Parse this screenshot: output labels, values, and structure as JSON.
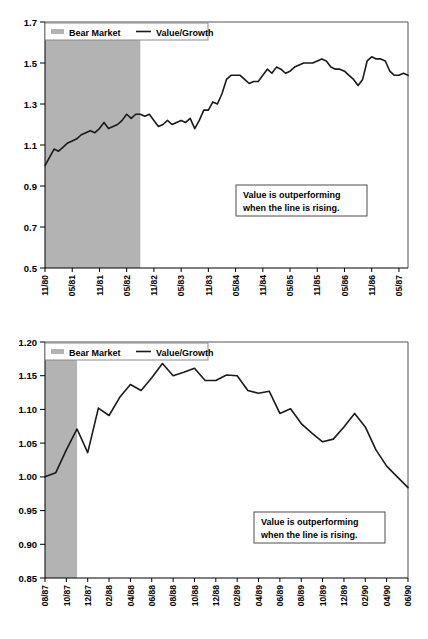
{
  "page": {
    "background": "#ffffff"
  },
  "colors": {
    "bear_band": "#b3b3b3",
    "series_line": "#1a1a1a",
    "axis": "#000000",
    "frame": "#555555",
    "annotation_border": "#4d4d4d"
  },
  "chart_data": [
    {
      "id": "chart-1",
      "type": "line",
      "title": "",
      "xlabel": "",
      "ylabel": "",
      "ylim": [
        0.5,
        1.7
      ],
      "yticks": [
        "0.5",
        "0.7",
        "0.9",
        "1.1",
        "1.3",
        "1.5",
        "1.7"
      ],
      "ytick_values": [
        0.5,
        0.7,
        0.9,
        1.1,
        1.3,
        1.5,
        1.7
      ],
      "grid": false,
      "legend_position": "top-left",
      "legend": [
        {
          "label": "Bear Market",
          "marker": "swatch",
          "color": "#b3b3b3"
        },
        {
          "label": "Value/Growth",
          "marker": "line",
          "color": "#1a1a1a"
        }
      ],
      "annotation": {
        "line1": "Value is outperforming",
        "line2": "when the line is rising."
      },
      "xticks": [
        "11/80",
        "05/81",
        "11/81",
        "05/82",
        "11/82",
        "05/83",
        "11/83",
        "05/84",
        "11/84",
        "05/85",
        "11/85",
        "05/86",
        "11/86",
        "05/87"
      ],
      "shaded_regions": [
        {
          "label": "Bear Market",
          "start": "11/80",
          "end": "08/82",
          "start_index": 0,
          "end_index": 21
        }
      ],
      "series": [
        {
          "name": "Value/Growth",
          "x": [
            "11/80",
            "12/80",
            "01/81",
            "02/81",
            "03/81",
            "04/81",
            "05/81",
            "06/81",
            "07/81",
            "08/81",
            "09/81",
            "10/81",
            "11/81",
            "12/81",
            "01/82",
            "02/82",
            "03/82",
            "04/82",
            "05/82",
            "06/82",
            "07/82",
            "08/82",
            "09/82",
            "10/82",
            "11/82",
            "12/82",
            "01/83",
            "02/83",
            "03/83",
            "04/83",
            "05/83",
            "06/83",
            "07/83",
            "08/83",
            "09/83",
            "10/83",
            "11/83",
            "12/83",
            "01/84",
            "02/84",
            "03/84",
            "04/84",
            "05/84",
            "06/84",
            "07/84",
            "08/84",
            "09/84",
            "10/84",
            "11/84",
            "12/84",
            "01/85",
            "02/85",
            "03/85",
            "04/85",
            "05/85",
            "06/85",
            "07/85",
            "08/85",
            "09/85",
            "10/85",
            "11/85",
            "12/85",
            "01/86",
            "02/86",
            "03/86",
            "04/86",
            "05/86",
            "06/86",
            "07/86",
            "08/86",
            "09/86",
            "10/86",
            "11/86",
            "12/86",
            "01/87",
            "02/87",
            "03/87",
            "04/87",
            "05/87",
            "06/87",
            "07/87"
          ],
          "values": [
            1.0,
            1.04,
            1.08,
            1.07,
            1.09,
            1.11,
            1.12,
            1.13,
            1.15,
            1.16,
            1.17,
            1.16,
            1.18,
            1.21,
            1.18,
            1.19,
            1.2,
            1.22,
            1.25,
            1.23,
            1.25,
            1.25,
            1.24,
            1.25,
            1.22,
            1.19,
            1.2,
            1.22,
            1.2,
            1.21,
            1.22,
            1.21,
            1.23,
            1.18,
            1.22,
            1.27,
            1.27,
            1.31,
            1.3,
            1.35,
            1.42,
            1.44,
            1.44,
            1.44,
            1.42,
            1.4,
            1.41,
            1.41,
            1.44,
            1.47,
            1.45,
            1.48,
            1.47,
            1.45,
            1.46,
            1.48,
            1.49,
            1.5,
            1.5,
            1.5,
            1.51,
            1.52,
            1.51,
            1.48,
            1.47,
            1.47,
            1.46,
            1.44,
            1.42,
            1.39,
            1.42,
            1.51,
            1.53,
            1.52,
            1.52,
            1.51,
            1.46,
            1.44,
            1.44,
            1.45,
            1.44
          ]
        }
      ]
    },
    {
      "id": "chart-2",
      "type": "line",
      "title": "",
      "xlabel": "",
      "ylabel": "",
      "ylim": [
        0.85,
        1.2
      ],
      "yticks": [
        "0.85",
        "0.90",
        "0.95",
        "1.00",
        "1.05",
        "1.10",
        "1.15",
        "1.20"
      ],
      "ytick_values": [
        0.85,
        0.9,
        0.95,
        1.0,
        1.05,
        1.1,
        1.15,
        1.2
      ],
      "grid": false,
      "legend_position": "top-left",
      "legend": [
        {
          "label": "Bear Market",
          "marker": "swatch",
          "color": "#b3b3b3"
        },
        {
          "label": "Value/Growth",
          "marker": "line",
          "color": "#1a1a1a"
        }
      ],
      "annotation": {
        "line1": "Value is outperforming",
        "line2": "when the line is rising."
      },
      "xticks": [
        "08/87",
        "10/87",
        "12/87",
        "02/88",
        "04/88",
        "06/88",
        "08/88",
        "10/88",
        "12/88",
        "02/89",
        "04/89",
        "06/89",
        "08/89",
        "10/89",
        "12/89",
        "02/90",
        "04/90",
        "06/90"
      ],
      "shaded_regions": [
        {
          "label": "Bear Market",
          "start": "08/87",
          "end": "11/87",
          "start_index": 0,
          "end_index": 3
        }
      ],
      "series": [
        {
          "name": "Value/Growth",
          "x": [
            "08/87",
            "09/87",
            "10/87",
            "11/87",
            "12/87",
            "01/88",
            "02/88",
            "03/88",
            "04/88",
            "05/88",
            "06/88",
            "07/88",
            "08/88",
            "09/88",
            "10/88",
            "11/88",
            "12/88",
            "01/89",
            "02/89",
            "03/89",
            "04/89",
            "05/89",
            "06/89",
            "07/89",
            "08/89",
            "09/89",
            "10/89",
            "11/89",
            "12/89",
            "01/90",
            "02/90",
            "03/90",
            "04/90",
            "05/90",
            "06/90"
          ],
          "values": [
            1.0,
            1.006,
            1.04,
            1.071,
            1.036,
            1.102,
            1.091,
            1.118,
            1.137,
            1.128,
            1.147,
            1.168,
            1.15,
            1.155,
            1.161,
            1.143,
            1.143,
            1.151,
            1.15,
            1.128,
            1.124,
            1.127,
            1.094,
            1.101,
            1.079,
            1.065,
            1.052,
            1.056,
            1.074,
            1.094,
            1.074,
            1.04,
            1.016,
            1.0,
            0.984
          ]
        }
      ]
    }
  ]
}
